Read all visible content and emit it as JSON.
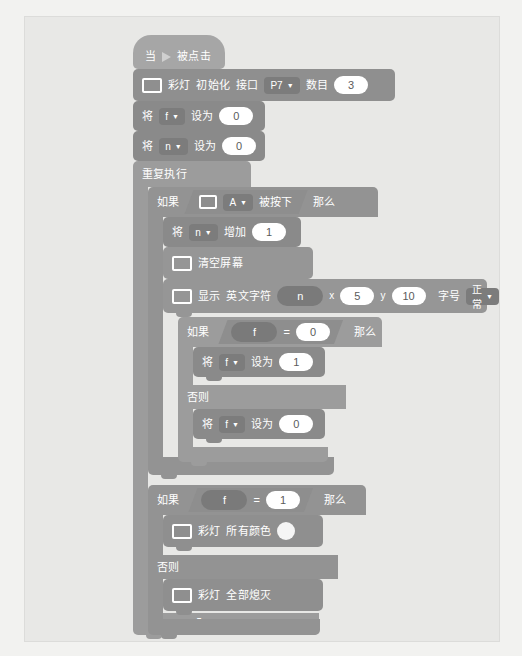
{
  "workspace": {
    "name": "block-code-workspace",
    "background_color": "#e8e8e6",
    "page_background": "#f2f2f0"
  },
  "palette": {
    "event_color": "#a6a6a6",
    "led_color": "#8f8f8f",
    "variable_color": "#8a8a8a",
    "control_color": "#9c9c9c",
    "operator_color": "#8e8e8e",
    "screen_color": "#969696",
    "input_fill": "#ffffff",
    "input_text": "#5b5b5b",
    "label_text": "#ffffff"
  },
  "script": {
    "hat": {
      "prefix": "当",
      "icon": "green-flag-icon",
      "suffix": "被点击"
    },
    "init_led": {
      "icon": "microbit-screen-icon",
      "label_1": "彩灯",
      "label_2": "初始化",
      "label_3": "接口",
      "port_value": "P7",
      "label_4": "数目",
      "count_value": "3"
    },
    "set_f_0": {
      "prefix": "将",
      "variable": "f",
      "verb": "设为",
      "value": "0"
    },
    "set_n_0": {
      "prefix": "将",
      "variable": "n",
      "verb": "设为",
      "value": "0"
    },
    "forever": {
      "label": "重复执行"
    },
    "if_button": {
      "if_label": "如果",
      "icon": "microbit-screen-icon",
      "button_value": "A",
      "condition_text": "被按下",
      "then_label": "那么"
    },
    "change_n": {
      "prefix": "将",
      "variable": "n",
      "verb": "增加",
      "value": "1"
    },
    "clear_screen": {
      "icon": "microbit-screen-icon",
      "label": "清空屏幕"
    },
    "show_char": {
      "icon": "microbit-screen-icon",
      "label_1": "显示",
      "label_2": "英文字符",
      "char_variable": "n",
      "x_label": "x",
      "x_value": "5",
      "y_label": "y",
      "y_value": "10",
      "color_value": "#4a4a4a",
      "size_label": "字号",
      "size_value": "正常"
    },
    "if_f_eq_0": {
      "if_label": "如果",
      "left_variable": "f",
      "operator": "=",
      "right_value": "0",
      "then_label": "那么",
      "else_label": "否则"
    },
    "set_f_1_inner": {
      "prefix": "将",
      "variable": "f",
      "verb": "设为",
      "value": "1"
    },
    "set_f_0_inner": {
      "prefix": "将",
      "variable": "f",
      "verb": "设为",
      "value": "0"
    },
    "if_f_eq_1": {
      "if_label": "如果",
      "left_variable": "f",
      "operator": "=",
      "right_value": "1",
      "then_label": "那么",
      "else_label": "否则"
    },
    "led_all_color": {
      "icon": "microbit-screen-icon",
      "label_1": "彩灯",
      "label_2": "所有颜色",
      "color_value": "#f5f5f5"
    },
    "led_all_off": {
      "icon": "microbit-screen-icon",
      "label_1": "彩灯",
      "label_2": "全部熄灭"
    },
    "loop_arrow_glyph": "↻"
  }
}
